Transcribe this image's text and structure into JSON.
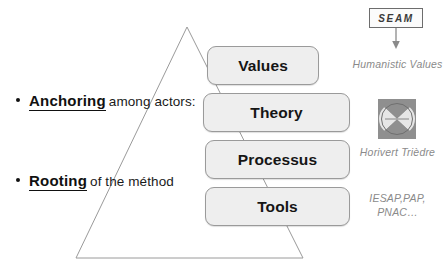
{
  "diagram": {
    "type": "pyramid-layer-diagram"
  },
  "pyramid": {
    "levels": [
      {
        "label": "Values"
      },
      {
        "label": "Theory"
      },
      {
        "label": "Processus"
      },
      {
        "label": "Tools"
      }
    ]
  },
  "bullets": [
    {
      "strong": "Anchoring",
      "rest": "among actors:"
    },
    {
      "strong": "Rooting",
      "rest": "of the méthod"
    }
  ],
  "right_column": {
    "source_box": {
      "label": "SEAM"
    },
    "arrow": {
      "direction": "down"
    },
    "captions": [
      {
        "text": "Humanistic Values"
      },
      {
        "text": "Horivert Trièdre"
      },
      {
        "text": "IESAP,PAP, PNAC…"
      }
    ],
    "icon": {
      "name": "horivert-trihedron-icon"
    }
  },
  "colors": {
    "box_fill": "#eeeeee",
    "box_border": "#9a9a9a",
    "text": "#151515",
    "caption_gray": "#8a8a8a",
    "icon_gray": "#8f8f8f",
    "triangle_stroke": "#9a9a9a"
  }
}
